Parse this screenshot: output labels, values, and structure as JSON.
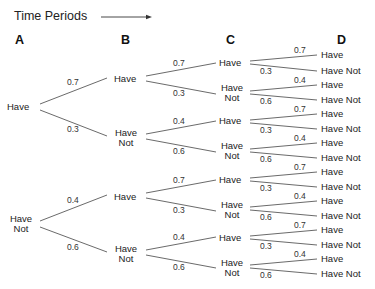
{
  "title": "Time Periods",
  "columns": [
    "A",
    "B",
    "C",
    "D"
  ],
  "labels": {
    "have": "Have",
    "have_not": "Have Not",
    "have_line": "Have",
    "not_line": "Not"
  },
  "probabilities": {
    "from_have": {
      "to_have": "0.7",
      "to_have_not": "0.3"
    },
    "from_have_not": {
      "to_have": "0.4",
      "to_have_not": "0.6"
    }
  },
  "tree": {
    "A": [
      {
        "state": "Have",
        "B": [
          {
            "prob": "0.7",
            "state": "Have",
            "C": [
              {
                "prob": "0.7",
                "state": "Have",
                "D": [
                  {
                    "prob": "0.7",
                    "state": "Have"
                  },
                  {
                    "prob": "0.3",
                    "state": "Have Not"
                  }
                ]
              },
              {
                "prob": "0.3",
                "state": "Have Not",
                "D": [
                  {
                    "prob": "0.4",
                    "state": "Have"
                  },
                  {
                    "prob": "0.6",
                    "state": "Have Not"
                  }
                ]
              }
            ]
          },
          {
            "prob": "0.3",
            "state": "Have Not",
            "C": [
              {
                "prob": "0.4",
                "state": "Have",
                "D": [
                  {
                    "prob": "0.7",
                    "state": "Have"
                  },
                  {
                    "prob": "0.3",
                    "state": "Have Not"
                  }
                ]
              },
              {
                "prob": "0.6",
                "state": "Have Not",
                "D": [
                  {
                    "prob": "0.4",
                    "state": "Have"
                  },
                  {
                    "prob": "0.6",
                    "state": "Have Not"
                  }
                ]
              }
            ]
          }
        ]
      },
      {
        "state": "Have Not",
        "B": [
          {
            "prob": "0.4",
            "state": "Have",
            "C": [
              {
                "prob": "0.7",
                "state": "Have",
                "D": [
                  {
                    "prob": "0.7",
                    "state": "Have"
                  },
                  {
                    "prob": "0.3",
                    "state": "Have Not"
                  }
                ]
              },
              {
                "prob": "0.3",
                "state": "Have Not",
                "D": [
                  {
                    "prob": "0.4",
                    "state": "Have"
                  },
                  {
                    "prob": "0.6",
                    "state": "Have Not"
                  }
                ]
              }
            ]
          },
          {
            "prob": "0.6",
            "state": "Have Not",
            "C": [
              {
                "prob": "0.4",
                "state": "Have",
                "D": [
                  {
                    "prob": "0.7",
                    "state": "Have"
                  },
                  {
                    "prob": "0.3",
                    "state": "Have Not"
                  }
                ]
              },
              {
                "prob": "0.6",
                "state": "Have Not",
                "D": [
                  {
                    "prob": "0.4",
                    "state": "Have"
                  },
                  {
                    "prob": "0.6",
                    "state": "Have Not"
                  }
                ]
              }
            ]
          }
        ]
      }
    ]
  }
}
